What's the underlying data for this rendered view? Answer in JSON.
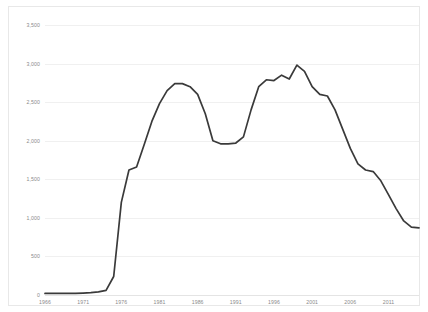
{
  "chart_data": {
    "type": "line",
    "title": "",
    "subtitle": "",
    "xlabel": "",
    "ylabel": "",
    "xlim": [
      1966,
      2015
    ],
    "ylim": [
      0,
      3500
    ],
    "grid": true,
    "legend": false,
    "legend_position": "none",
    "line_color": "#3a3a3a",
    "ytick_labels": [
      "3,500",
      "3,000",
      "2,500",
      "2,000",
      "1,500",
      "1,000",
      "500",
      "0"
    ],
    "ytick_values": [
      3500,
      3000,
      2500,
      2000,
      1500,
      1000,
      500,
      0
    ],
    "xtick_labels": [
      "1966",
      "1971",
      "1976",
      "1981",
      "1986",
      "1991",
      "1996",
      "2001",
      "2006",
      "2011"
    ],
    "xtick_values": [
      1966,
      1971,
      1976,
      1981,
      1986,
      1991,
      1996,
      2001,
      2006,
      2011
    ],
    "series": [
      {
        "name": "series-1",
        "x": [
          1966,
          1967,
          1968,
          1969,
          1970,
          1971,
          1972,
          1973,
          1974,
          1975,
          1976,
          1977,
          1978,
          1979,
          1980,
          1981,
          1982,
          1983,
          1984,
          1985,
          1986,
          1987,
          1988,
          1989,
          1990,
          1991,
          1992,
          1993,
          1994,
          1995,
          1996,
          1997,
          1998,
          1999,
          2000,
          2001,
          2002,
          2003,
          2004,
          2005,
          2006,
          2007,
          2008,
          2009,
          2010,
          2011,
          2012,
          2013,
          2014,
          2015
        ],
        "values": [
          20,
          20,
          20,
          20,
          20,
          25,
          30,
          40,
          60,
          240,
          1200,
          1620,
          1660,
          1950,
          2250,
          2480,
          2650,
          2740,
          2740,
          2700,
          2600,
          2350,
          2000,
          1960,
          1960,
          1970,
          2050,
          2400,
          2700,
          2790,
          2780,
          2850,
          2800,
          2980,
          2900,
          2700,
          2600,
          2580,
          2400,
          2150,
          1900,
          1700,
          1620,
          1600,
          1480,
          1300,
          1120,
          960,
          880,
          870
        ]
      }
    ]
  }
}
